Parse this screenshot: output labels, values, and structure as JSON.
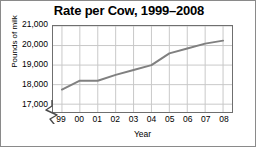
{
  "chart_data": {
    "type": "line",
    "title": "Rate per Cow, 1999–2008",
    "xlabel": "Year",
    "ylabel": "Pounds of milk",
    "categories": [
      "99",
      "00",
      "01",
      "02",
      "03",
      "04",
      "05",
      "06",
      "07",
      "08"
    ],
    "x_full": [
      1999,
      2000,
      2001,
      2002,
      2003,
      2004,
      2005,
      2006,
      2007,
      2008
    ],
    "values": [
      17750,
      18200,
      18200,
      18500,
      18750,
      19000,
      19600,
      19850,
      20100,
      20250
    ],
    "ylim": [
      16600,
      21000
    ],
    "yticks": [
      17000,
      18000,
      19000,
      20000,
      21000
    ],
    "ytick_labels": [
      "17,000",
      "18,000",
      "19,000",
      "20,000",
      "21,000"
    ],
    "grid": true,
    "legend": false,
    "axis_break": true,
    "line_color": "#808080",
    "grid_color": "#c8c8c8",
    "frame_color": "#6f6f6f"
  },
  "figure": {
    "background": "#ffffff",
    "border_color": "#8a8a8a"
  }
}
